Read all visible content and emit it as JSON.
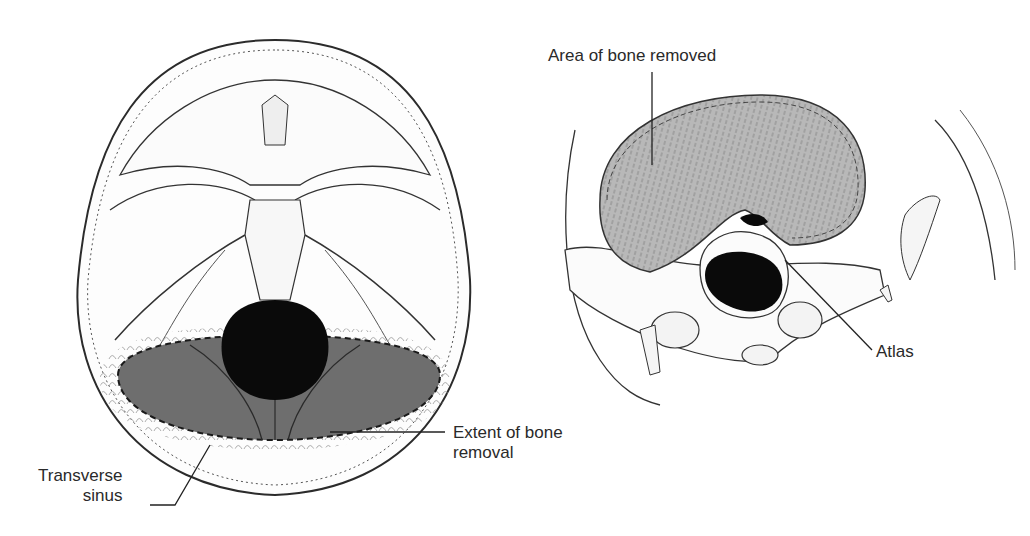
{
  "figure": {
    "left_panel": {
      "view": "skull base, superior view",
      "labels": {
        "extent": [
          "Extent of bone",
          "removal"
        ],
        "sinus": [
          "Transverse",
          "sinus"
        ]
      }
    },
    "right_panel": {
      "view": "posterior oblique view",
      "labels": {
        "area": "Area of bone removed",
        "atlas": "Atlas"
      }
    },
    "colors": {
      "line": "#2b2b2b",
      "removal_fill": "#6e6e6e",
      "removed_area_fill": "#b4b4b4",
      "foramen": "#0a0a0a",
      "bone": "#fbfbfb"
    }
  }
}
